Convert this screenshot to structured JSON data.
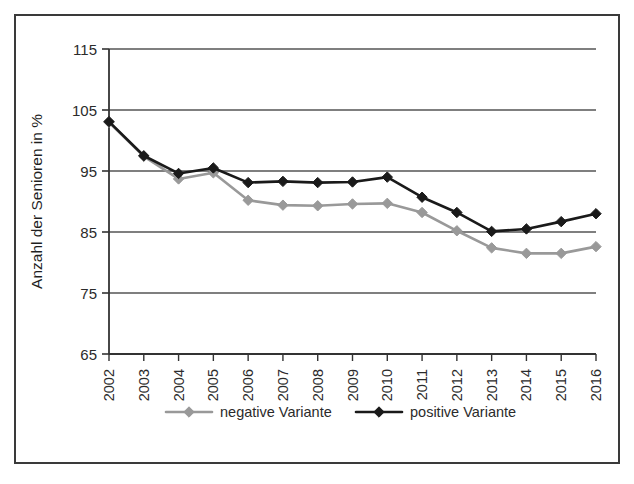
{
  "figure": {
    "border_color": "#3a3a3a",
    "background": "#ffffff"
  },
  "chart_data": {
    "type": "line",
    "title": "",
    "subtitle": "",
    "xlabel": "",
    "ylabel": "Anzahl der Senioren in %",
    "categories": [
      "2002",
      "2003",
      "2004",
      "2005",
      "2006",
      "2007",
      "2008",
      "2009",
      "2010",
      "2011",
      "2012",
      "2013",
      "2014",
      "2015",
      "2016"
    ],
    "x": [
      2002,
      2003,
      2004,
      2005,
      2006,
      2007,
      2008,
      2009,
      2010,
      2011,
      2012,
      2013,
      2014,
      2015,
      2016
    ],
    "ylim": [
      65,
      115
    ],
    "yticks": [
      65,
      75,
      85,
      95,
      105,
      115
    ],
    "ytick_labels": [
      "65",
      "75",
      "85",
      "95",
      "105",
      "115"
    ],
    "grid": "horizontal",
    "legend_position": "bottom",
    "series": [
      {
        "name": "negative Variante",
        "color": "#999999",
        "marker": "diamond",
        "values": [
          103.0,
          97.4,
          93.7,
          94.7,
          90.2,
          89.4,
          89.3,
          89.6,
          89.7,
          88.2,
          85.2,
          82.4,
          81.5,
          81.5,
          82.6
        ]
      },
      {
        "name": "positive Variante",
        "color": "#1a1a1a",
        "marker": "diamond",
        "values": [
          103.1,
          97.5,
          94.6,
          95.5,
          93.1,
          93.3,
          93.1,
          93.2,
          94.0,
          90.7,
          88.2,
          85.1,
          85.5,
          86.7,
          88.0
        ]
      }
    ]
  },
  "legend": {
    "items": [
      {
        "label": "negative Variante",
        "color": "#999999"
      },
      {
        "label": "positive Variante",
        "color": "#1a1a1a"
      }
    ]
  }
}
